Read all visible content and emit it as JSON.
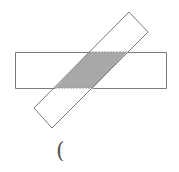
{
  "diagram": {
    "shapes": [
      {
        "name": "horizontal-rectangle",
        "type": "rectangle",
        "orientation": "horizontal"
      },
      {
        "name": "tilted-rectangle",
        "type": "rectangle",
        "orientation": "tilted"
      },
      {
        "name": "overlap-region",
        "type": "parallelogram",
        "shaded": true
      }
    ],
    "colors": {
      "stroke": "#7a7a7a",
      "shade": "#a8a8a8",
      "background": "#ffffff"
    }
  },
  "answer_blank": "("
}
